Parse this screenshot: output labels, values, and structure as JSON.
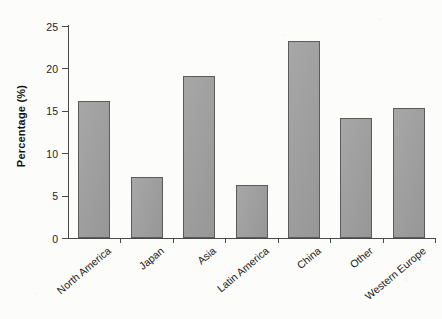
{
  "chart_data": {
    "type": "bar",
    "title": "",
    "subtitle": "",
    "xlabel": "",
    "ylabel": "Percentage (%)",
    "categories": [
      "North America",
      "Japan",
      "Asia",
      "Latin America",
      "China",
      "Other",
      "Western Europe"
    ],
    "values": [
      16.2,
      7.2,
      19.1,
      6.2,
      23.2,
      14.2,
      15.3
    ],
    "ylim": [
      0,
      25
    ],
    "ytick_labels": [
      "0",
      "5",
      "10",
      "15",
      "20",
      "25"
    ],
    "ytick_values": [
      0,
      5,
      10,
      15,
      20,
      25
    ],
    "grid": false,
    "legend": null,
    "legend_position": "none",
    "annotations": [],
    "bar_color": "#9d9d9d",
    "bar_border_color": "#5b5b5b",
    "axis_color": "#4a4a4a",
    "background_color": "#fcfcfb",
    "xlabel_rotation_deg": -40
  }
}
